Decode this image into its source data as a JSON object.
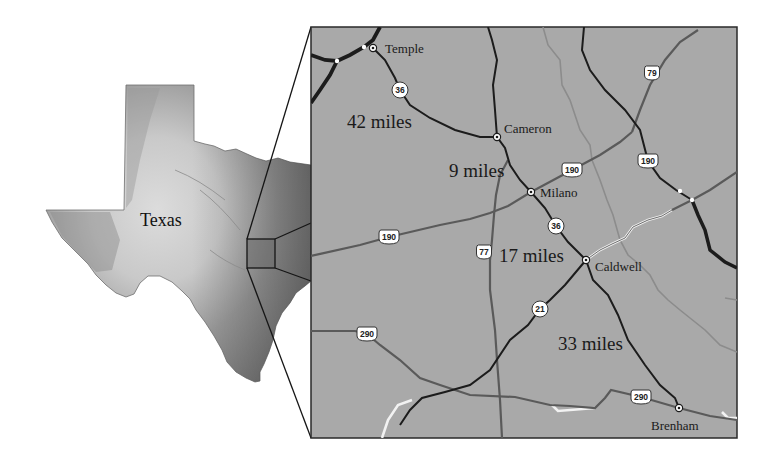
{
  "state": {
    "label": "Texas"
  },
  "cities": [
    {
      "id": "temple",
      "label": "Temple",
      "x": 373,
      "y": 48,
      "label_x": 385,
      "label_y": 53
    },
    {
      "id": "cameron",
      "label": "Cameron",
      "x": 497,
      "y": 137,
      "label_x": 504,
      "label_y": 133
    },
    {
      "id": "milano",
      "label": "Milano",
      "x": 531,
      "y": 192,
      "label_x": 540,
      "label_y": 197
    },
    {
      "id": "caldwell",
      "label": "Caldwell",
      "x": 586,
      "y": 260,
      "label_x": 595,
      "label_y": 271
    },
    {
      "id": "brenham",
      "label": "Brenham",
      "x": 679,
      "y": 408,
      "label_x": 651,
      "label_y": 430
    }
  ],
  "distances": [
    {
      "id": "temple-cameron",
      "label": "42 miles",
      "x": 347,
      "y": 128
    },
    {
      "id": "cameron-milano",
      "label": "9 miles",
      "x": 449,
      "y": 177
    },
    {
      "id": "milano-caldwell",
      "label": "17 miles",
      "x": 499,
      "y": 262
    },
    {
      "id": "caldwell-brenham",
      "label": "33 miles",
      "x": 558,
      "y": 350
    }
  ],
  "route_shields": [
    {
      "id": "sh-36-north",
      "type": "state",
      "number": "36",
      "x": 400,
      "y": 90
    },
    {
      "id": "sh-36-south",
      "type": "state",
      "number": "36",
      "x": 556,
      "y": 226
    },
    {
      "id": "sh-21",
      "type": "state",
      "number": "21",
      "x": 540,
      "y": 309
    },
    {
      "id": "us-190-west",
      "type": "us",
      "number": "190",
      "x": 389,
      "y": 237
    },
    {
      "id": "us-190-mid",
      "type": "us",
      "number": "190",
      "x": 572,
      "y": 170
    },
    {
      "id": "us-190-east",
      "type": "us",
      "number": "190",
      "x": 648,
      "y": 161
    },
    {
      "id": "us-79",
      "type": "us",
      "number": "79",
      "x": 652,
      "y": 73
    },
    {
      "id": "us-77",
      "type": "us",
      "number": "77",
      "x": 484,
      "y": 252
    },
    {
      "id": "us-290-west",
      "type": "us",
      "number": "290",
      "x": 367,
      "y": 334
    },
    {
      "id": "us-290-east",
      "type": "us",
      "number": "290",
      "x": 641,
      "y": 397
    }
  ],
  "colors": {
    "map_background": "#a9a9a9",
    "map_border": "#2a2a2a",
    "road_black": "#1c1c1c",
    "road_gray": "#5a5a5a",
    "river": "#8c8c8c",
    "shield_fill": "#ffffff"
  }
}
